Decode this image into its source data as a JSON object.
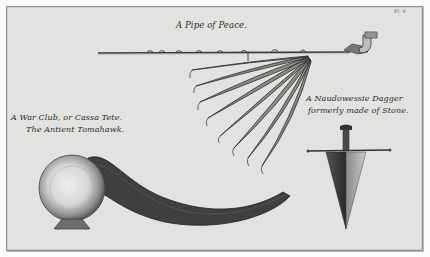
{
  "plate": {
    "plate_number": "Pl. 4",
    "background_color": "#e2e2e0",
    "ink_color": "#2c2c2c"
  },
  "captions": {
    "pipe": "A Pipe of Peace.",
    "club_line1": "A War Club, or Cassa Tete.",
    "club_line2": "The Antient Tomahawk.",
    "dagger_line1": "A Naudowessie Dagger",
    "dagger_line2": "formerly made of Stone."
  },
  "figures": [
    {
      "name": "pipe-of-peace",
      "description": "long calumet stem with bowl and fan of feathers"
    },
    {
      "name": "war-club",
      "description": "ball-headed curved club"
    },
    {
      "name": "naudowessie-dagger",
      "description": "triangular stone blade with crossguard"
    }
  ]
}
